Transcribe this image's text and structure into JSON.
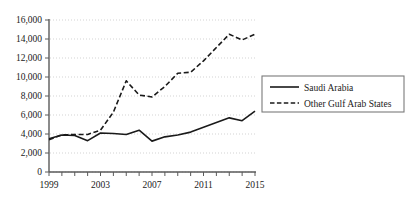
{
  "chart_data": {
    "type": "line",
    "title": "",
    "subtitle": "",
    "xlabel": "",
    "ylabel": "",
    "xlim": [
      1999,
      2015
    ],
    "ylim": [
      0,
      16000
    ],
    "grid": true,
    "legend_position": "right",
    "x": [
      1999,
      2000,
      2001,
      2002,
      2003,
      2004,
      2005,
      2006,
      2007,
      2008,
      2009,
      2010,
      2011,
      2012,
      2013,
      2014,
      2015
    ],
    "y_ticks": [
      0,
      2000,
      4000,
      6000,
      8000,
      10000,
      12000,
      14000,
      16000
    ],
    "y_tick_labels": [
      "0",
      "2,000",
      "4,000",
      "6,000",
      "8,000",
      "10,000",
      "12,000",
      "14,000",
      "16,000"
    ],
    "x_ticks": [
      1999,
      2000,
      2001,
      2002,
      2003,
      2004,
      2005,
      2006,
      2007,
      2008,
      2009,
      2010,
      2011,
      2012,
      2013,
      2014,
      2015
    ],
    "x_tick_labels_shown": [
      "1999",
      "2003",
      "2007",
      "2011",
      "2015"
    ],
    "x_tick_label_years": [
      1999,
      2003,
      2007,
      2011,
      2015
    ],
    "series": [
      {
        "name": "Saudi Arabia",
        "style": "solid",
        "color": "#1a1a1a",
        "values": [
          3500,
          3900,
          3850,
          3300,
          4100,
          4050,
          3950,
          4400,
          3250,
          3700,
          3900,
          4200,
          4700,
          5200,
          5700,
          5400,
          6400
        ]
      },
      {
        "name": "Other Gulf Arab States",
        "style": "dashed",
        "color": "#1a1a1a",
        "values": [
          3400,
          3900,
          3950,
          3950,
          4400,
          6300,
          9600,
          8100,
          7900,
          9000,
          10400,
          10500,
          11700,
          13100,
          14500,
          13900,
          14500
        ]
      }
    ],
    "legend": [
      {
        "label": "Saudi Arabia",
        "style": "solid"
      },
      {
        "label": "Other Gulf Arab States",
        "style": "dashed"
      }
    ]
  }
}
